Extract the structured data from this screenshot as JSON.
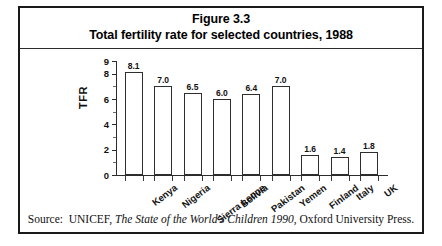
{
  "figure": {
    "title_line1": "Figure 3.3",
    "title_line2": "Total fertility rate for selected countries, 1988",
    "source_prefix": "Source:  UNICEF, ",
    "source_italic": "The State of the World's Children 1990",
    "source_suffix": ", Oxford University Press."
  },
  "chart_data": {
    "type": "bar",
    "title": "Total fertility rate for selected countries, 1988",
    "xlabel": "",
    "ylabel": "TFR",
    "ylim": [
      0,
      9
    ],
    "yticks": [
      0,
      2,
      4,
      6,
      8,
      9
    ],
    "ytick_labels": [
      "0",
      "2",
      "4",
      "6",
      "8",
      "9"
    ],
    "grid": false,
    "legend": null,
    "bar_fill": "#ffffff",
    "bar_edge": "#2e2e2e",
    "categories": [
      "Kenya",
      "Nigeria",
      "Sierra Leone",
      "Bolivia",
      "Pakistan",
      "Yemen",
      "Finland",
      "Italy",
      "UK"
    ],
    "values": [
      8.1,
      7.0,
      6.5,
      6.0,
      6.4,
      7.0,
      1.6,
      1.4,
      1.8
    ],
    "value_labels": [
      "8.1",
      "7.0",
      "6.5",
      "6.0",
      "6.4",
      "7.0",
      "1.6",
      "1.4",
      "1.8"
    ]
  }
}
